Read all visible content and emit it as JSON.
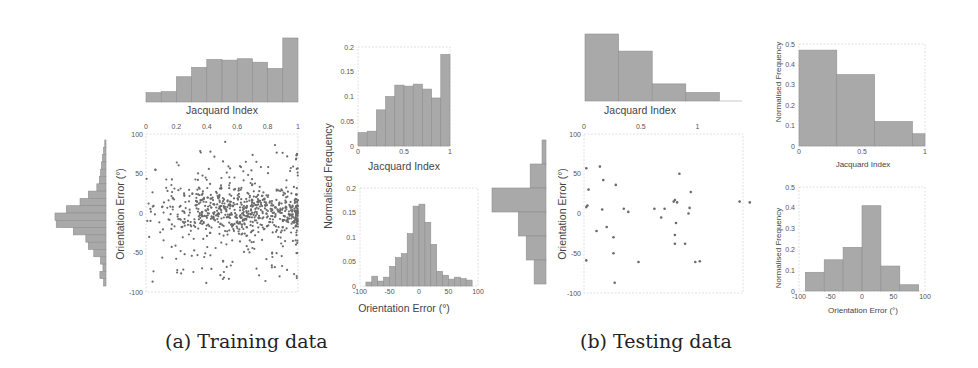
{
  "captions": {
    "a": "(a) Training data",
    "b": "(b) Testing data"
  },
  "colors": {
    "bar": "#a9a9a9",
    "bar_edge": "#8f8f8f",
    "dot": "#6a6a6a",
    "frame": "#d8d8d8"
  },
  "chart_data": [
    {
      "id": "train_scatter",
      "type": "scatter",
      "title": "",
      "xlabel": "Jacquard Index",
      "ylabel": "Orientation Error (°)",
      "xlim": [
        0,
        1
      ],
      "ylim": [
        -100,
        100
      ],
      "xticks": [
        "0",
        "0.2",
        "0.4",
        "0.6",
        "0.8",
        "1"
      ],
      "yticks": [
        "100",
        "50",
        "0",
        "-50",
        "-100"
      ],
      "description": "~800 points; dense band near 0° error concentrated at Jacquard 0.4–1.0; spread ±90°",
      "n_points": 800,
      "marginals": {
        "top_hist": [
          0.027,
          0.03,
          0.073,
          0.1,
          0.123,
          0.121,
          0.125,
          0.115,
          0.097,
          0.185
        ],
        "side_hist": [
          0.004,
          0.008,
          0.012,
          0.015,
          0.018,
          0.022,
          0.03,
          0.058,
          0.085,
          0.13,
          0.167,
          0.163,
          0.107,
          0.066,
          0.058,
          0.04,
          0.018,
          0.01,
          0.02,
          0.008
        ]
      }
    },
    {
      "id": "train_jacquard_hist",
      "type": "bar",
      "title": "",
      "xlabel": "Jacquard Index",
      "ylabel": "Normalised Frequency",
      "bin_edges": [
        0,
        0.1,
        0.2,
        0.3,
        0.4,
        0.5,
        0.6,
        0.7,
        0.8,
        0.9,
        1.0
      ],
      "values": [
        0.027,
        0.03,
        0.073,
        0.1,
        0.123,
        0.121,
        0.125,
        0.115,
        0.097,
        0.185
      ],
      "xlim": [
        0,
        1
      ],
      "ylim": [
        0,
        0.2
      ],
      "xticks": [
        "0",
        "0.5",
        "1"
      ],
      "yticks": [
        "0",
        "0.05",
        "0.1",
        "0.15",
        "0.2"
      ]
    },
    {
      "id": "train_orientation_hist",
      "type": "bar",
      "title": "",
      "xlabel": "Orientation Error (°)",
      "ylabel": "Normalised Frequency",
      "bin_edges": [
        -90,
        -80,
        -70,
        -60,
        -50,
        -40,
        -30,
        -20,
        -10,
        0,
        10,
        20,
        30,
        40,
        50,
        60,
        70,
        80,
        90
      ],
      "values": [
        0.008,
        0.02,
        0.01,
        0.018,
        0.04,
        0.058,
        0.066,
        0.107,
        0.163,
        0.167,
        0.13,
        0.085,
        0.03,
        0.022,
        0.014,
        0.018,
        0.015,
        0.012
      ],
      "xlim": [
        -100,
        100
      ],
      "ylim": [
        0,
        0.2
      ],
      "xticks": [
        "-100",
        "-50",
        "0",
        "50",
        "100"
      ],
      "yticks": [
        "0",
        "0.05",
        "0.1",
        "0.15",
        "0.2"
      ]
    },
    {
      "id": "test_scatter",
      "type": "scatter",
      "title": "",
      "xlabel": "Jacquard Index",
      "ylabel": "Orientation Error (°)",
      "xlim": [
        0,
        1.4
      ],
      "ylim": [
        -100,
        100
      ],
      "xticks": [
        "0",
        "0.5",
        "1"
      ],
      "yticks": [
        "100",
        "50",
        "0",
        "-50",
        "-100"
      ],
      "points": [
        [
          0.02,
          57
        ],
        [
          0.14,
          59
        ],
        [
          0.17,
          42
        ],
        [
          0.04,
          30
        ],
        [
          0.28,
          36
        ],
        [
          0.84,
          50
        ],
        [
          0.02,
          8
        ],
        [
          0.03,
          10
        ],
        [
          0.16,
          5
        ],
        [
          0.35,
          6
        ],
        [
          0.39,
          2
        ],
        [
          0.62,
          6
        ],
        [
          0.71,
          6
        ],
        [
          0.79,
          15
        ],
        [
          0.8,
          17
        ],
        [
          0.82,
          14
        ],
        [
          0.94,
          27
        ],
        [
          0.93,
          7
        ],
        [
          0.92,
          0
        ],
        [
          1.37,
          15
        ],
        [
          1.46,
          14
        ],
        [
          0.68,
          -5
        ],
        [
          0.81,
          -12
        ],
        [
          0.2,
          -17
        ],
        [
          0.11,
          -22
        ],
        [
          0.26,
          -30
        ],
        [
          0.8,
          -27
        ],
        [
          0.8,
          -38
        ],
        [
          0.89,
          -38
        ],
        [
          0.26,
          -50
        ],
        [
          0.02,
          -59
        ],
        [
          0.48,
          -61
        ],
        [
          0.98,
          -61
        ],
        [
          1.02,
          -60
        ],
        [
          0.27,
          -87
        ]
      ],
      "marginals": {
        "top_hist": [
          0.47,
          0.35,
          0.12,
          0.06
        ],
        "side_hist": [
          0.03,
          0.12,
          0.41,
          0.21,
          0.15,
          0.09
        ]
      }
    },
    {
      "id": "test_jacquard_hist",
      "type": "bar",
      "title": "",
      "xlabel": "Jacquard Index",
      "ylabel": "Normalised Frequency",
      "bin_edges": [
        0,
        0.3,
        0.6,
        0.9,
        1.0
      ],
      "values": [
        0.47,
        0.35,
        0.12,
        0.06
      ],
      "xlim": [
        0,
        1
      ],
      "ylim": [
        0,
        0.5
      ],
      "xticks": [
        "0",
        "0.5",
        "1"
      ],
      "yticks": [
        "0",
        "0.1",
        "0.2",
        "0.3",
        "0.4",
        "0.5"
      ]
    },
    {
      "id": "test_orientation_hist",
      "type": "bar",
      "title": "",
      "xlabel": "Orientation Error (°)",
      "ylabel": "Normalised Frequency",
      "bin_edges": [
        -90,
        -60,
        -30,
        0,
        30,
        60,
        90
      ],
      "values": [
        0.09,
        0.15,
        0.21,
        0.41,
        0.12,
        0.03
      ],
      "xlim": [
        -100,
        100
      ],
      "ylim": [
        0,
        0.5
      ],
      "xticks": [
        "-100",
        "-50",
        "0",
        "50",
        "100"
      ],
      "yticks": [
        "0",
        "0.1",
        "0.2",
        "0.3",
        "0.4",
        "0.5"
      ]
    }
  ]
}
